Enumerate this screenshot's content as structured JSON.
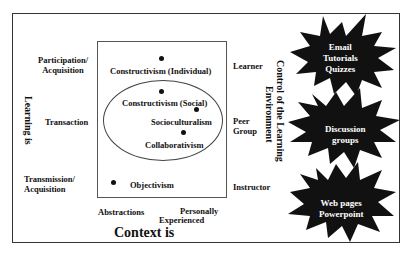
{
  "diagram": {
    "y_axis": {
      "title": "Learning is",
      "levels": [
        "Participation/ Acquisition",
        "Transaction",
        "Transmission/ Acquisition"
      ],
      "level_lines": [
        [
          "Participation/",
          "Acquisition"
        ],
        [
          "Transaction"
        ],
        [
          "Transmission/",
          "Acquisition"
        ]
      ]
    },
    "x_axis": {
      "title": "Context is",
      "left_label": "Abstractions",
      "right_label_line1": "Personally",
      "right_label_line2": "Experienced"
    },
    "right_axis": {
      "title_line1": "Control of the Learning",
      "title_line2": "Environment",
      "levels": [
        "Learner",
        "Peer Group",
        "Instructor"
      ],
      "level_lines": [
        [
          "Learner"
        ],
        [
          "Peer",
          "Group"
        ],
        [
          "Instructor"
        ]
      ]
    },
    "points": [
      {
        "label": "Constructivism (Individual)"
      },
      {
        "label": "Constructivism (Social)"
      },
      {
        "label": "Socioculturalism"
      },
      {
        "label": "Collaborativism"
      },
      {
        "label": "Objectivism"
      }
    ],
    "tools": [
      {
        "lines": [
          "Email",
          "Tutorials",
          "Quizzes"
        ]
      },
      {
        "lines": [
          "Discussion",
          "groups"
        ]
      },
      {
        "lines": [
          "Web pages",
          "Powerpoint"
        ]
      }
    ],
    "colors": {
      "burst_fill": "#111111",
      "burst_text": "#ffffff",
      "line": "#333333"
    }
  }
}
